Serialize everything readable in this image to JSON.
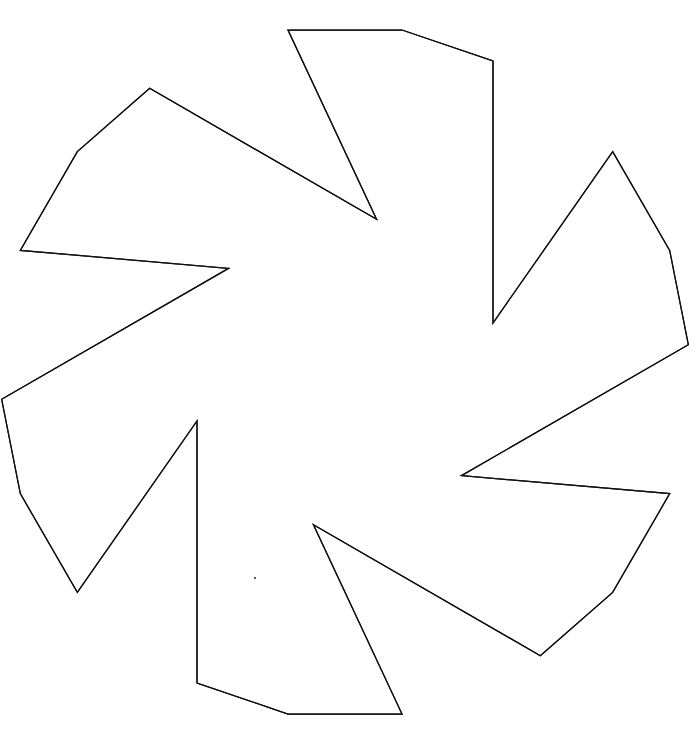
{
  "document": {
    "title": "Interlaced Twelve-Point Geometric Rosette",
    "background_color": "#ffffff",
    "width": 700,
    "height": 743
  },
  "figure": {
    "name": "interlaced-hexagonal-rosette",
    "stroke_color": "#111111",
    "stroke_width": 1.25,
    "fill": "none",
    "center_x": 345,
    "center_y": 372,
    "symmetry_order": 6,
    "path_count": 2
  },
  "chart_data": {
    "type": "scatter",
    "xlabel": "",
    "ylabel": "",
    "xlim": [
      0,
      700
    ],
    "ylim": [
      0,
      743
    ],
    "grid": false,
    "legend": "none",
    "center": [
      345,
      372
    ],
    "paths": [
      {
        "name": "star-polygon-a",
        "closed": true,
        "points": [
          [
            288,
            30
          ],
          [
            402,
            30
          ],
          [
            493,
            61
          ],
          [
            493,
            323
          ],
          [
            586,
            128
          ],
          [
            641,
            209
          ],
          [
            527,
            372
          ],
          [
            641,
            535
          ],
          [
            586,
            617
          ],
          [
            493,
            422
          ],
          [
            493,
            686
          ],
          [
            402,
            717
          ]
        ]
      },
      {
        "name": "star-polygon-b",
        "closed": true,
        "points": [
          [
            288,
            718
          ],
          [
            194,
            686
          ],
          [
            194,
            422
          ],
          [
            103,
            618
          ],
          [
            48,
            539
          ],
          [
            160,
            372
          ],
          [
            48,
            213
          ],
          [
            103,
            132
          ],
          [
            194,
            323
          ],
          [
            194,
            61
          ]
        ]
      }
    ],
    "outer_tips": [
      [
        345,
        30
      ],
      [
        586,
        128
      ],
      [
        676,
        372
      ],
      [
        586,
        617
      ],
      [
        345,
        718
      ],
      [
        103,
        618
      ],
      [
        11,
        372
      ],
      [
        103,
        132
      ]
    ],
    "inner_notches": [
      [
        345,
        211
      ],
      [
        527,
        372
      ],
      [
        345,
        533
      ],
      [
        160,
        372
      ]
    ],
    "annotations": [
      {
        "name": "speck",
        "x": 255,
        "y": 578,
        "r": 1.1,
        "color": "#3a3a3a"
      }
    ]
  }
}
